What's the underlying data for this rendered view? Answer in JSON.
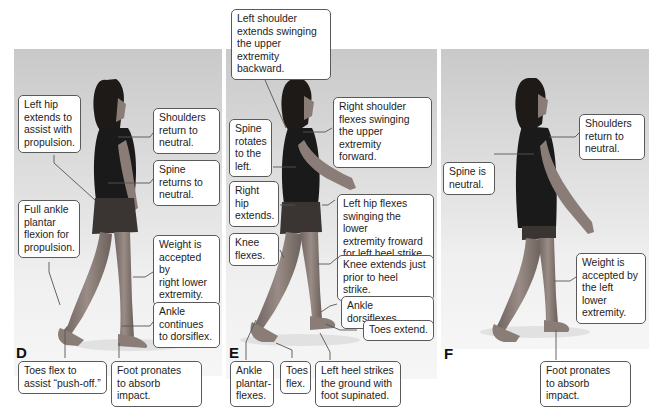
{
  "figure": {
    "panels": [
      {
        "letter": "D",
        "callouts": [
          "Left hip\nextends to\nassist with\npropulsion.",
          "Shoulders\nreturn to\nneutral.",
          "Spine\nreturns to\nneutral.",
          "Full ankle\nplantar\nflexion for\npropulsion.",
          "Weight is\naccepted by\nright lower\nextremity.",
          "Ankle\ncontinues\nto dorsiflex.",
          "Toes flex to\nassist “push-off.”",
          "Foot pronates\nto absorb impact."
        ]
      },
      {
        "letter": "E",
        "callouts": [
          "Left shoulder\nextends swinging\nthe upper extremity\nbackward.",
          "Right shoulder\nflexes swinging\nthe upper extremity\nforward.",
          "Spine\nrotates\nto the\nleft.",
          "Right\nhip\nextends.",
          "Left hip flexes\nswinging the lower\nextremity froward\nfor left heel strike.",
          "Knee\nflexes.",
          "Knee extends just\nprior to heel strike.",
          "Ankle dorsiflexes.",
          "Toes extend.",
          "Ankle\nplantar-\nflexes.",
          "Toes\nflex.",
          "Left heel strikes\nthe ground with\nfoot supinated."
        ]
      },
      {
        "letter": "F",
        "callouts": [
          "Shoulders\nreturn to\nneutral.",
          "Spine is\nneutral.",
          "Weight is\naccepted by\nthe left lower\nextremity.",
          "Foot pronates\nto absorb impact."
        ]
      }
    ],
    "colors": {
      "callout_border": "#5a5a5a",
      "leader_line": "#555555",
      "panel_top": "#c9c9c9",
      "panel_bottom": "#f7f7f7",
      "shirt": "#1a1a1a",
      "shorts": "#3a3432",
      "skin": "#8a7d78",
      "hair": "#1e1a18"
    }
  }
}
